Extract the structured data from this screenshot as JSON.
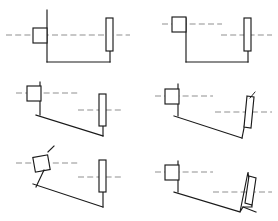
{
  "figure": {
    "background_color": "#ffffff",
    "line_color": "#1a1a1a",
    "centerline_color": "#8f8f8f",
    "columns": 2,
    "rows": 3,
    "panel_count": 6
  },
  "panels": [
    {
      "id": "panel-1",
      "name": "configuration-1",
      "position": "row-1-col-1",
      "bottom_member": "horizontal",
      "left_block": "upright",
      "right_bar": "upright",
      "centerline_mode": "single-through-both",
      "wedge": false
    },
    {
      "id": "panel-2",
      "name": "configuration-2",
      "position": "row-1-col-2",
      "bottom_member": "horizontal",
      "left_block": "raised-upright",
      "right_bar": "upright",
      "centerline_mode": "split-offset",
      "wedge": false
    },
    {
      "id": "panel-3",
      "name": "configuration-3",
      "position": "row-2-col-1",
      "bottom_member": "sloped-shallow",
      "left_block": "upright",
      "right_bar": "upright",
      "centerline_mode": "split-offset",
      "wedge": false
    },
    {
      "id": "panel-4",
      "name": "configuration-4",
      "position": "row-2-col-2",
      "bottom_member": "sloped-shallow",
      "left_block": "upright",
      "right_bar": "tilted",
      "centerline_mode": "split-offset",
      "wedge": false
    },
    {
      "id": "panel-5",
      "name": "configuration-5",
      "position": "row-3-col-1",
      "bottom_member": "sloped-steep",
      "left_block": "tilted",
      "right_bar": "upright",
      "centerline_mode": "split-offset",
      "wedge": false
    },
    {
      "id": "panel-6",
      "name": "configuration-6",
      "position": "row-3-col-2",
      "bottom_member": "sloped-steep",
      "left_block": "upright",
      "right_bar": "tilted",
      "centerline_mode": "split-offset",
      "wedge": true
    }
  ]
}
